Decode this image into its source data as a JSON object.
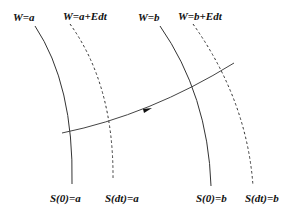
{
  "diagram": {
    "top_labels": [
      {
        "text": "W=a",
        "x": 13,
        "y": 12
      },
      {
        "text": "W=a+Edt",
        "x": 63,
        "y": 11
      },
      {
        "text": "W=b",
        "x": 138,
        "y": 12
      },
      {
        "text": "W=b+Edt",
        "x": 178,
        "y": 11
      }
    ],
    "bottom_labels": [
      {
        "text": "S(0)=a",
        "x": 50,
        "y": 193
      },
      {
        "text": "S(dt)=a",
        "x": 105,
        "y": 193
      },
      {
        "text": "S(0)=b",
        "x": 196,
        "y": 193
      },
      {
        "text": "S(dt)=b",
        "x": 245,
        "y": 193
      }
    ],
    "curves": [
      {
        "name": "w-a-solid",
        "style": "solid",
        "path": "M35,26 Q74,85 72,184"
      },
      {
        "name": "w-a-edt-dashed",
        "style": "dashed",
        "path": "M70,24 Q114,85 113,180"
      },
      {
        "name": "w-b-solid",
        "style": "solid",
        "path": "M160,26 Q208,95 211,186"
      },
      {
        "name": "w-b-edt-dashed",
        "style": "dashed",
        "path": "M193,24 Q247,100 253,186"
      }
    ],
    "trajectory": {
      "path": "M62,133 Q150,115 234,63",
      "arrow_at": {
        "x": 147,
        "y": 110,
        "angle": -14
      }
    },
    "colors": {
      "line": "#333333",
      "text": "#111111",
      "background": "#ffffff"
    }
  }
}
